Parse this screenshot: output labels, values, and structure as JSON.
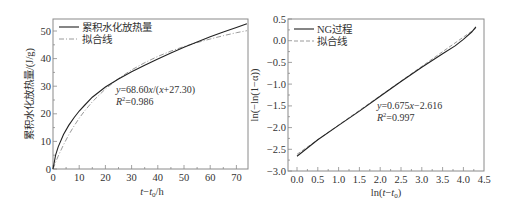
{
  "chart_data": [
    {
      "type": "line",
      "title": "",
      "xlabel": "t−t0/h",
      "ylabel": "累积水化放热量/(J/g)",
      "xlim": [
        0,
        74.5
      ],
      "ylim": [
        0,
        54
      ],
      "xticks": [
        0,
        10,
        20,
        30,
        40,
        50,
        60,
        70
      ],
      "yticks": [
        0,
        10,
        20,
        30,
        40,
        50
      ],
      "grid": false,
      "legend_position": "upper left",
      "legend": [
        "累积水化放热量",
        "拟合线"
      ],
      "series": [
        {
          "name": "累积水化放热量",
          "style": "solid",
          "x": [
            0,
            1,
            2,
            4,
            6,
            8,
            10,
            12,
            15,
            20,
            25,
            30,
            35,
            40,
            45,
            50,
            55,
            60,
            65,
            70,
            74
          ],
          "y": [
            0,
            5,
            8,
            12.5,
            15.8,
            18.6,
            21,
            23,
            26,
            29.7,
            32.6,
            35.2,
            37.6,
            39.9,
            42,
            44.1,
            46,
            47.9,
            49.6,
            51.3,
            52.6
          ]
        },
        {
          "name": "拟合线",
          "style": "dash-dot",
          "x": [
            0,
            1,
            2,
            4,
            6,
            8,
            10,
            12,
            15,
            20,
            25,
            30,
            35,
            40,
            45,
            50,
            55,
            60,
            65,
            70,
            74
          ],
          "y": [
            0,
            2.42,
            4.68,
            8.77,
            12.36,
            15.55,
            18.39,
            20.95,
            24.33,
            29.0,
            32.8,
            35.9,
            38.5,
            40.8,
            42.7,
            44.4,
            45.8,
            47.1,
            48.3,
            49.4,
            50.1
          ]
        }
      ],
      "annotations": [
        "y=68.60x/(x+27.30)",
        "R²=0.986"
      ]
    },
    {
      "type": "line",
      "title": "",
      "xlabel": "ln(t−t0)",
      "ylabel": "ln(−ln(1−α))",
      "xlim": [
        -0.15,
        4.5
      ],
      "ylim": [
        -3.0,
        0.5
      ],
      "xticks": [
        0.0,
        0.5,
        1.0,
        1.5,
        2.0,
        2.5,
        3.0,
        3.5,
        4.0,
        4.5
      ],
      "yticks": [
        -3.0,
        -2.5,
        -2.0,
        -1.5,
        -1.0,
        -0.5,
        0.0,
        0.5
      ],
      "grid": false,
      "legend_position": "upper left",
      "legend": [
        "NG过程",
        "拟合线"
      ],
      "series": [
        {
          "name": "NG过程",
          "style": "solid",
          "x": [
            0.0,
            0.5,
            1.0,
            1.5,
            2.0,
            2.5,
            3.0,
            3.5,
            3.8,
            4.0,
            4.2,
            4.3
          ],
          "y": [
            -2.66,
            -2.28,
            -1.95,
            -1.62,
            -1.28,
            -0.94,
            -0.61,
            -0.3,
            -0.12,
            0.03,
            0.2,
            0.32
          ]
        },
        {
          "name": "拟合线",
          "style": "dashed",
          "x": [
            0.0,
            0.5,
            1.0,
            1.5,
            2.0,
            2.5,
            3.0,
            3.5,
            4.0,
            4.3
          ],
          "y": [
            -2.616,
            -2.279,
            -1.941,
            -1.604,
            -1.266,
            -0.929,
            -0.591,
            -0.254,
            0.084,
            0.287
          ]
        }
      ],
      "annotations": [
        "y=0.675x−2.616",
        "R²=0.997"
      ]
    }
  ],
  "left": {
    "legend": {
      "item1": "累积水化放热量",
      "item2": "拟合线"
    },
    "annot": {
      "eq_y": "y",
      "eq_rest": "=68.60",
      "eq_x1": "x",
      "eq_mid": "/(",
      "eq_x2": "x",
      "eq_end": "+27.30)",
      "r_R": "R",
      "r_sup": "2",
      "r_rest": "=0.986"
    },
    "xlabel": {
      "t": "t",
      "dash": "−",
      "t0": "t",
      "sub": "0",
      "unit": "/h"
    },
    "ylabel": "累积水化放热量/(J/g)",
    "xticks": [
      "0",
      "10",
      "20",
      "30",
      "40",
      "50",
      "60",
      "70"
    ],
    "yticks": [
      "0",
      "10",
      "20",
      "30",
      "40",
      "50"
    ]
  },
  "right": {
    "legend": {
      "item1": "NG过程",
      "item2": "拟合线"
    },
    "annot": {
      "eq_y": "y",
      "eq_rest": "=0.675",
      "eq_x": "x",
      "eq_end": "−2.616",
      "r_R": "R",
      "r_sup": "2",
      "r_rest": "=0.997"
    },
    "xlabel": {
      "ln": "ln(",
      "t": "t",
      "dash": "−",
      "t0": "t",
      "sub": "0",
      "close": ")"
    },
    "ylabel": "ln(−ln(1−α))",
    "xticks": [
      "0.0",
      "0.5",
      "1.0",
      "1.5",
      "2.0",
      "2.5",
      "3.0",
      "3.5",
      "4.0",
      "4.5"
    ],
    "yticks": [
      "0.5",
      "0.0",
      "−0.5",
      "−1.0",
      "−1.5",
      "−2.0",
      "−2.5",
      "−3.0"
    ]
  },
  "colors": {
    "axis": "#888888",
    "data_line": "#222222",
    "fit_line": "#9a9a9a",
    "text": "#333333"
  }
}
